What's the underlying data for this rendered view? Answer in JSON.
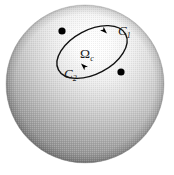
{
  "figure": {
    "background_color": "#ffffff",
    "width": 174,
    "height": 175
  },
  "sphere": {
    "name": "shaded-sphere",
    "center_x": 85,
    "center_y": 84,
    "radius": 79,
    "highlight_x": 128,
    "highlight_y": 44,
    "highlight_color": "#ffffff",
    "mid_color": "#c9c9c9",
    "shadow_color": "#6e6e6e",
    "edge_color": "#8f8f8f"
  },
  "contour": {
    "name": "closed-contour-ellipse",
    "center_x": 92,
    "center_y": 52,
    "radius_x": 38,
    "radius_y": 22,
    "rotation_deg": -28,
    "stroke_color": "#111111",
    "stroke_width": 1.4,
    "orientation": "clockwise"
  },
  "points": [
    {
      "name": "contour-point-upper-left",
      "x": 62,
      "y": 31,
      "radius": 3.6,
      "color": "#000000"
    },
    {
      "name": "contour-point-lower-right",
      "x": 121,
      "y": 72,
      "radius": 3.6,
      "color": "#000000"
    }
  ],
  "arrows": [
    {
      "name": "arrowhead-upper-arc",
      "x": 106,
      "y": 33,
      "angle_deg": 52,
      "color": "#000000"
    },
    {
      "name": "arrowhead-lower-arc",
      "x": 82,
      "y": 63,
      "angle_deg": 228,
      "color": "#000000"
    }
  ],
  "labels": {
    "c1": {
      "base": "C",
      "sub": "1"
    },
    "omega": {
      "base": "Ω",
      "sub": "c"
    },
    "c2": {
      "base": "C",
      "sub": "2"
    }
  }
}
